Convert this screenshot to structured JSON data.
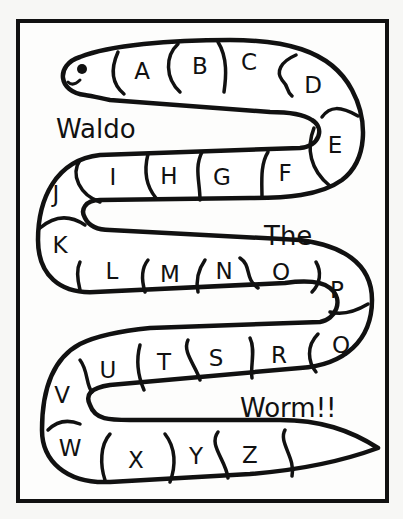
{
  "worksheet": {
    "title_words": [
      "Waldo",
      "The",
      "Worm!!"
    ],
    "letters": [
      "A",
      "B",
      "C",
      "D",
      "E",
      "F",
      "G",
      "H",
      "I",
      "J",
      "K",
      "L",
      "M",
      "N",
      "O",
      "P",
      "Q",
      "R",
      "S",
      "T",
      "U",
      "V",
      "W",
      "X",
      "Y",
      "Z"
    ]
  },
  "icons": {
    "worm": "worm-outline",
    "eye": "worm-eye"
  },
  "colors": {
    "ink": "#111111",
    "paper": "#fdfdfc"
  }
}
